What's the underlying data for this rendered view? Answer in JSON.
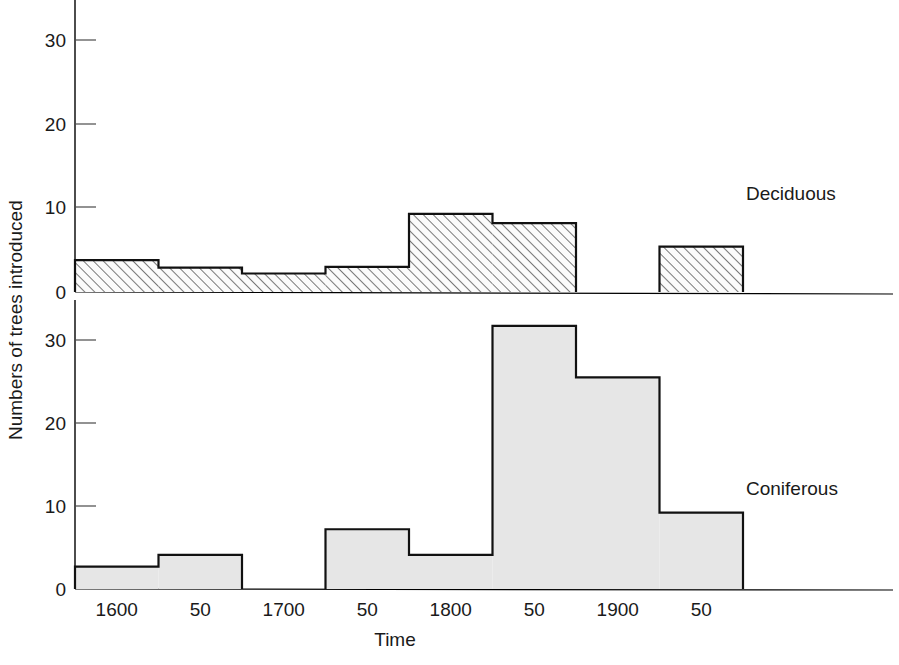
{
  "figure": {
    "y_axis_title": "Numbers of trees introduced",
    "x_axis_title": "Time",
    "caption": ""
  },
  "panels": {
    "top": {
      "series_label": "Deciduous",
      "y_ticks": [
        "0",
        "10",
        "20",
        "30"
      ]
    },
    "bottom": {
      "series_label": "Coniferous",
      "y_ticks": [
        "0",
        "10",
        "20",
        "30"
      ]
    }
  },
  "x_ticks": [
    "1600",
    "50",
    "1700",
    "50",
    "1800",
    "50",
    "1900",
    "50"
  ],
  "colors": {
    "ink": "#1a1a1a",
    "outline": "#111111",
    "deciduous_fill": "#f2f2f2",
    "coniferous_fill": "#e6e6e6",
    "axis": "#000000"
  },
  "chart_data": {
    "type": "bar",
    "title": "",
    "subtitle": "",
    "xlabel": "Time",
    "ylabel": "Numbers of trees introduced",
    "grid": false,
    "legend_position": "inline-right",
    "orientation": "vertical",
    "layout": "two stacked panels sharing one x axis; top panel Deciduous, bottom panel Coniferous",
    "bin_edges": [
      1550,
      1600,
      1650,
      1700,
      1750,
      1800,
      1850,
      1900,
      1950
    ],
    "categories": [
      "1550-1600",
      "1600-1650",
      "1650-1700",
      "1700-1750",
      "1750-1800",
      "1800-1850",
      "1850-1900",
      "1900-1950"
    ],
    "tick_labels": [
      "1600",
      "50",
      "1700",
      "50",
      "1800",
      "50",
      "1900",
      "50"
    ],
    "xlim": [
      1550,
      1990
    ],
    "ylim": [
      0,
      33
    ],
    "yticks": [
      0,
      10,
      20,
      30
    ],
    "series": [
      {
        "name": "Deciduous",
        "panel": "top",
        "values": [
          3.8,
          2.9,
          2.2,
          3.0,
          9.3,
          8.2,
          0,
          5.4
        ]
      },
      {
        "name": "Coniferous",
        "panel": "bottom",
        "values": [
          2.7,
          4.1,
          0,
          7.2,
          4.1,
          31.7,
          25.5,
          9.2
        ]
      }
    ]
  }
}
